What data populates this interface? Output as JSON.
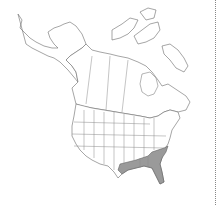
{
  "map": {
    "region": "North America",
    "type": "species range map",
    "shaded_color": "#9a9a9a",
    "outline_color": "#6a6a6a",
    "background_color": "#ffffff",
    "shaded_regions": [
      "Louisiana",
      "Mississippi",
      "Alabama",
      "Georgia",
      "Florida",
      "South Carolina",
      "North Carolina",
      "East Texas"
    ]
  }
}
